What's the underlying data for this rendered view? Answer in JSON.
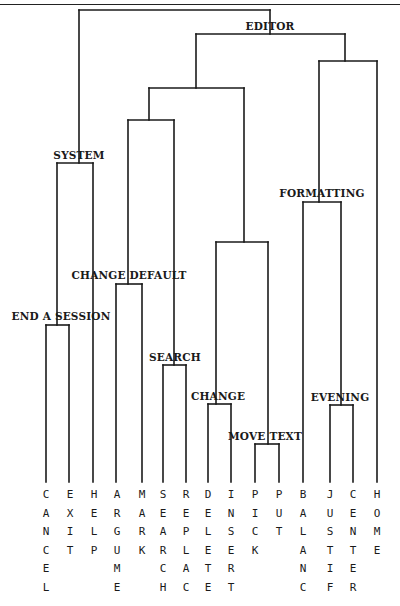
{
  "diagram": {
    "type": "dendrogram",
    "root_label": "",
    "nodes": [
      {
        "id": "root",
        "label": "",
        "y": 10,
        "x1": 79,
        "x2": 270
      },
      {
        "id": "editor",
        "label": "EDITOR",
        "y": 34,
        "x1": 196,
        "x2": 345,
        "label_x": 270,
        "label_y": 30
      },
      {
        "id": "system",
        "label": "SYSTEM",
        "y": 163,
        "x1": 57,
        "x2": 93,
        "label_x": 79,
        "label_y": 159
      },
      {
        "id": "end_a_session",
        "label": "END A SESSION",
        "y": 325,
        "x1": 46,
        "x2": 69,
        "label_x": 61,
        "label_y": 320
      },
      {
        "id": "left_editor",
        "label": "",
        "y": 88,
        "x1": 149,
        "x2": 244
      },
      {
        "id": "cd_search",
        "label": "",
        "y": 120,
        "x1": 128,
        "x2": 174
      },
      {
        "id": "change_default",
        "label": "CHANGE DEFAULT",
        "y": 284,
        "x1": 116,
        "x2": 142,
        "label_x": 129,
        "label_y": 279
      },
      {
        "id": "search",
        "label": "SEARCH",
        "y": 365,
        "x1": 163,
        "x2": 186,
        "label_x": 175,
        "label_y": 361
      },
      {
        "id": "change_move",
        "label": "",
        "y": 242,
        "x1": 216,
        "x2": 268
      },
      {
        "id": "change",
        "label": "CHANGE",
        "y": 404,
        "x1": 208,
        "x2": 231,
        "label_x": 218,
        "label_y": 400
      },
      {
        "id": "move_text",
        "label": "MOVE TEXT",
        "y": 444,
        "x1": 255,
        "x2": 279,
        "label_x": 265,
        "label_y": 440
      },
      {
        "id": "format_home",
        "label": "",
        "y": 61,
        "x1": 319,
        "x2": 377
      },
      {
        "id": "formatting",
        "label": "FORMATTING",
        "y": 202,
        "x1": 303,
        "x2": 341,
        "label_x": 322,
        "label_y": 197
      },
      {
        "id": "evening",
        "label": "EVENING",
        "y": 405,
        "x1": 330,
        "x2": 353,
        "label_x": 340,
        "label_y": 401
      }
    ],
    "stems": [
      {
        "x": 79,
        "y1": 10,
        "y2": 163
      },
      {
        "x": 270,
        "y1": 10,
        "y2": 34
      },
      {
        "x": 196,
        "y1": 34,
        "y2": 88
      },
      {
        "x": 345,
        "y1": 34,
        "y2": 61
      },
      {
        "x": 149,
        "y1": 88,
        "y2": 120
      },
      {
        "x": 244,
        "y1": 88,
        "y2": 242
      },
      {
        "x": 128,
        "y1": 120,
        "y2": 284
      },
      {
        "x": 174,
        "y1": 120,
        "y2": 365
      },
      {
        "x": 57,
        "y1": 163,
        "y2": 325
      },
      {
        "x": 93,
        "y1": 163,
        "y2": 482
      },
      {
        "x": 216,
        "y1": 242,
        "y2": 404
      },
      {
        "x": 268,
        "y1": 242,
        "y2": 444
      },
      {
        "x": 319,
        "y1": 61,
        "y2": 202
      },
      {
        "x": 377,
        "y1": 61,
        "y2": 482
      },
      {
        "x": 303,
        "y1": 202,
        "y2": 482
      },
      {
        "x": 341,
        "y1": 202,
        "y2": 405
      },
      {
        "x": 46,
        "y1": 325,
        "y2": 482
      },
      {
        "x": 69,
        "y1": 325,
        "y2": 482
      },
      {
        "x": 116,
        "y1": 284,
        "y2": 482
      },
      {
        "x": 142,
        "y1": 284,
        "y2": 482
      },
      {
        "x": 163,
        "y1": 365,
        "y2": 482
      },
      {
        "x": 186,
        "y1": 365,
        "y2": 482
      },
      {
        "x": 208,
        "y1": 404,
        "y2": 482
      },
      {
        "x": 231,
        "y1": 404,
        "y2": 482
      },
      {
        "x": 255,
        "y1": 444,
        "y2": 482
      },
      {
        "x": 279,
        "y1": 444,
        "y2": 482
      },
      {
        "x": 330,
        "y1": 405,
        "y2": 482
      },
      {
        "x": 353,
        "y1": 405,
        "y2": 482
      }
    ],
    "leaves": [
      {
        "label": "CANCEL",
        "x": 46
      },
      {
        "label": "EXIT",
        "x": 70
      },
      {
        "label": "HELP",
        "x": 94
      },
      {
        "label": "ARGUME",
        "x": 117
      },
      {
        "label": "MARK",
        "x": 142
      },
      {
        "label": "SEARCH",
        "x": 163
      },
      {
        "label": "REPLAC",
        "x": 186
      },
      {
        "label": "DELETE",
        "x": 208
      },
      {
        "label": "INSERT",
        "x": 231
      },
      {
        "label": "PICK",
        "x": 255
      },
      {
        "label": "PUT",
        "x": 279
      },
      {
        "label": "BALANC",
        "x": 303
      },
      {
        "label": "JUSTIF",
        "x": 330
      },
      {
        "label": "CENTER",
        "x": 353
      },
      {
        "label": "HOME",
        "x": 377
      }
    ],
    "leaf_top_y": 498,
    "leaf_line_height": 18.5
  }
}
